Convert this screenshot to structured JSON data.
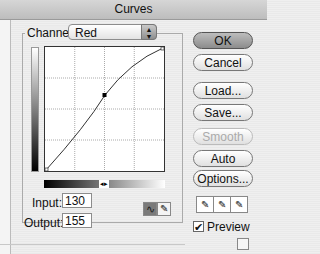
{
  "window": {
    "title": "Curves"
  },
  "channel": {
    "label": "Channel:",
    "value": "Red"
  },
  "graph": {
    "grid_divisions": 4,
    "curve_points": [
      [
        0,
        0
      ],
      [
        130,
        155
      ],
      [
        255,
        255
      ]
    ],
    "selected_point": {
      "input": 130,
      "output": 155
    }
  },
  "fields": {
    "input_label": "Input:",
    "input_value": "130",
    "output_label": "Output:",
    "output_value": "155"
  },
  "buttons": {
    "ok": "OK",
    "cancel": "Cancel",
    "load": "Load...",
    "save": "Save...",
    "smooth": "Smooth",
    "auto": "Auto",
    "options": "Options..."
  },
  "preview": {
    "label": "Preview",
    "checked": true
  },
  "icons": {
    "select_arrows": "⬍",
    "slider_knob": "◂▸",
    "curve_mode": "∿",
    "pencil_mode": "✎",
    "check": "✔",
    "eyedropper": "✎"
  }
}
